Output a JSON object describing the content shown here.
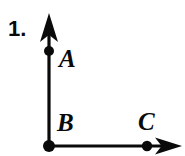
{
  "figure": {
    "item_number": "1.",
    "colors": {
      "ink": "#0a0a0a",
      "background": "#ffffff"
    },
    "labels": {
      "point_a": "A",
      "point_b": "B",
      "point_c": "C"
    },
    "points": {
      "a": {
        "name": "A",
        "x": 49,
        "y": 51,
        "dot_radius": 5
      },
      "b": {
        "name": "B",
        "x": 49,
        "y": 146,
        "dot_radius": 6
      },
      "c": {
        "name": "C",
        "x": 147,
        "y": 146,
        "dot_radius": 5
      }
    },
    "rays": [
      {
        "name": "ray-ba-vertical",
        "from": "B",
        "through": "A",
        "direction": "up",
        "arrow_tip": {
          "x": 49,
          "y": 14
        },
        "stroke_width": 3
      },
      {
        "name": "ray-bc-horizontal",
        "from": "B",
        "through": "C",
        "direction": "right",
        "arrow_tip": {
          "x": 181,
          "y": 146
        },
        "stroke_width": 3
      }
    ]
  }
}
